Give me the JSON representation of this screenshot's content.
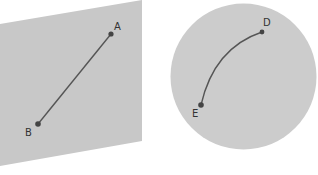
{
  "diagram": {
    "colors": {
      "background": "#ffffff",
      "plane_fill": "#c8c8c8",
      "sphere_fill": "#cccccc",
      "line": "#555555",
      "point": "#444444",
      "label": "#333333"
    },
    "plane": {
      "shape": "flat-plane",
      "points": [
        {
          "label": "A",
          "x": 111,
          "y": 34
        },
        {
          "label": "B",
          "x": 38,
          "y": 124
        }
      ],
      "segment": {
        "from": "A",
        "to": "B",
        "kind": "straight"
      }
    },
    "sphere": {
      "shape": "sphere",
      "points": [
        {
          "label": "D",
          "x": 262,
          "y": 32
        },
        {
          "label": "E",
          "x": 201,
          "y": 105
        }
      ],
      "segment": {
        "from": "D",
        "to": "E",
        "kind": "curved-arc"
      }
    },
    "labels": {
      "A": "A",
      "B": "B",
      "D": "D",
      "E": "E"
    }
  }
}
